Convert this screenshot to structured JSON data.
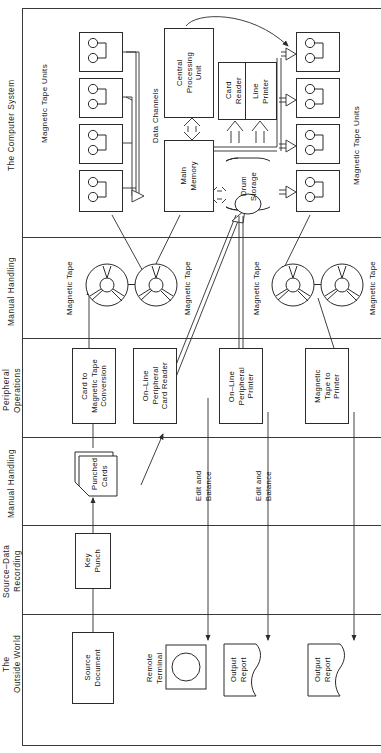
{
  "diagram": {
    "orientation": "rotated-90-ccw",
    "stroke_color": "#2b2b2b"
  },
  "bands": [
    {
      "id": "computer-system",
      "label": "The Computer System"
    },
    {
      "id": "manual-handling-1",
      "label": "Manual Handling"
    },
    {
      "id": "peripheral-ops",
      "label": "Peripheral\nOperations"
    },
    {
      "id": "manual-handling-2",
      "label": "Manual Handling"
    },
    {
      "id": "source-data",
      "label": "Source–Data\nRecording"
    },
    {
      "id": "outside-world",
      "label": "The\nOutside World"
    }
  ],
  "computer_system": {
    "left_group_label": "Magnetic Tape Units",
    "right_group_label": "Magnetic Tape Units",
    "data_channels_label": "Data Channels",
    "units": {
      "cpu": "Central\nProcessing\nUnit",
      "main_memory": "Main\nMemory",
      "card_reader": "Card\nReader",
      "line_printer": "Line\nPrinter",
      "drum_storage": "Drum\nStorage"
    },
    "left_tape_units": [
      "tape-unit-1",
      "tape-unit-2",
      "tape-unit-3",
      "tape-unit-4"
    ],
    "right_tape_units": [
      "tape-unit-5",
      "tape-unit-6",
      "tape-unit-7",
      "tape-unit-8"
    ]
  },
  "manual_handling_upper": {
    "reel_labels": [
      "Magnetic Tape",
      "Magnetic Tape",
      "Magnetic Tape",
      "Magnetic Tape"
    ]
  },
  "peripheral_operations": {
    "boxes": [
      "Card to\nMagnetic Tape\nConversion",
      "On–Line\nPeripheral\nCard Reader",
      "On–Line\nPeripheral\nPrinter",
      "Magnetic\nTape to\nPrinter"
    ]
  },
  "manual_handling_lower": {
    "punched_cards": "Punched\nCards",
    "flow_labels": [
      "Edit and\nBalance",
      "Edit and\nBalance"
    ]
  },
  "source_data_recording": {
    "key_punch": "Key\nPunch"
  },
  "outside_world": {
    "items": [
      "Source\nDocument",
      "Remote\nTerminal",
      "Output\nReport",
      "Output\nReport"
    ]
  }
}
